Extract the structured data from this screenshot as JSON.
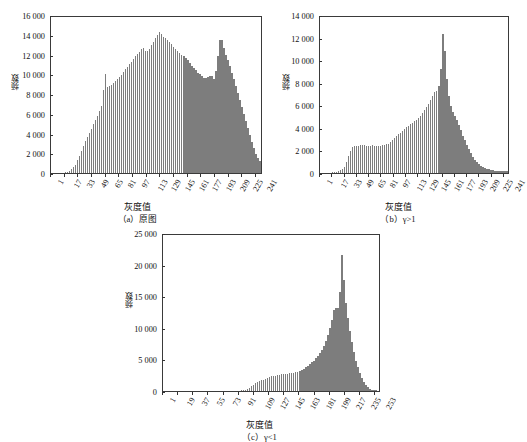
{
  "page": {
    "background": "#ffffff",
    "bar_color": "#7d7d7d",
    "axis_color": "#3a3a3a",
    "width": 519,
    "height": 442
  },
  "figures": [
    {
      "id": "a",
      "caption": "（a）原图",
      "xlabel": "灰度值",
      "ylabel": "频数"
    },
    {
      "id": "b",
      "caption": "（b）γ>1",
      "xlabel": "灰度值",
      "ylabel": "频数"
    },
    {
      "id": "c",
      "caption": "（c）γ<1",
      "xlabel": "灰度值",
      "ylabel": "频数"
    }
  ],
  "chart_data": [
    {
      "type": "bar",
      "title": "（a）原图",
      "xlabel": "灰度值",
      "ylabel": "频数",
      "ylim": [
        0,
        16000
      ],
      "yticks": [
        0,
        2000,
        4000,
        6000,
        8000,
        10000,
        12000,
        14000,
        16000
      ],
      "ytick_labels": [
        "0",
        "2 000",
        "4 000",
        "6 000",
        "8 000",
        "10 000",
        "12 000",
        "14 000",
        "16 000"
      ],
      "xlim": [
        1,
        249
      ],
      "xticks": [
        1,
        17,
        33,
        49,
        65,
        81,
        97,
        113,
        129,
        145,
        161,
        177,
        193,
        209,
        225,
        241
      ],
      "xtick_labels": [
        "1",
        "17",
        "33",
        "49",
        "65",
        "81",
        "97",
        "113",
        "129",
        "145",
        "161",
        "177",
        "193",
        "209",
        "225",
        "241"
      ],
      "grid": false,
      "legend": false,
      "x": [
        1,
        5,
        9,
        13,
        17,
        21,
        25,
        29,
        33,
        37,
        41,
        45,
        49,
        53,
        57,
        61,
        63,
        65,
        67,
        69,
        73,
        77,
        81,
        85,
        89,
        93,
        97,
        101,
        105,
        109,
        113,
        117,
        121,
        125,
        129,
        131,
        133,
        137,
        141,
        145,
        149,
        153,
        157,
        161,
        165,
        169,
        173,
        177,
        181,
        185,
        189,
        193,
        196,
        199,
        201,
        203,
        205,
        209,
        213,
        217,
        221,
        225,
        229,
        233,
        237,
        241,
        245,
        249
      ],
      "values": [
        10,
        15,
        20,
        30,
        60,
        150,
        400,
        800,
        1500,
        2400,
        3200,
        3900,
        4600,
        5400,
        6100,
        7000,
        9000,
        10200,
        8700,
        8800,
        9000,
        9300,
        9700,
        10100,
        10600,
        11000,
        11400,
        11900,
        12300,
        12800,
        12200,
        12600,
        13200,
        13800,
        14300,
        14100,
        13800,
        13600,
        13200,
        12800,
        12400,
        12100,
        11800,
        11500,
        11000,
        10600,
        10200,
        9900,
        9600,
        9700,
        9900,
        9500,
        11000,
        13400,
        13600,
        13200,
        12200,
        11400,
        10300,
        9200,
        8000,
        6800,
        5600,
        4400,
        3200,
        2100,
        1400,
        1000
      ]
    },
    {
      "type": "bar",
      "title": "（b）γ>1",
      "xlabel": "灰度值",
      "ylabel": "频数",
      "ylim": [
        0,
        14000
      ],
      "yticks": [
        0,
        2000,
        4000,
        6000,
        8000,
        10000,
        12000,
        14000
      ],
      "ytick_labels": [
        "0",
        "2 000",
        "4 000",
        "6 000",
        "8 000",
        "10 000",
        "12 000",
        "14 000"
      ],
      "xlim": [
        1,
        249
      ],
      "xticks": [
        1,
        17,
        33,
        49,
        65,
        81,
        97,
        113,
        129,
        145,
        161,
        177,
        193,
        209,
        225,
        241
      ],
      "xtick_labels": [
        "1",
        "17",
        "33",
        "49",
        "65",
        "81",
        "97",
        "113",
        "129",
        "145",
        "161",
        "177",
        "193",
        "209",
        "225",
        "241"
      ],
      "grid": false,
      "legend": false,
      "x": [
        1,
        5,
        9,
        13,
        17,
        21,
        25,
        29,
        33,
        36,
        39,
        42,
        45,
        48,
        51,
        54,
        57,
        61,
        65,
        69,
        73,
        77,
        81,
        85,
        89,
        93,
        97,
        101,
        105,
        109,
        113,
        117,
        121,
        125,
        129,
        133,
        137,
        141,
        145,
        149,
        152,
        155,
        158,
        160,
        162,
        164,
        166,
        168,
        171,
        174,
        177,
        181,
        185,
        189,
        193,
        197,
        201,
        205,
        209,
        213,
        217,
        221,
        225,
        229,
        233,
        237,
        241,
        245,
        249
      ],
      "values": [
        10,
        15,
        20,
        30,
        50,
        80,
        150,
        300,
        600,
        1100,
        1700,
        2200,
        2400,
        2350,
        2400,
        2450,
        2500,
        2400,
        2350,
        2450,
        2400,
        2350,
        2400,
        2500,
        2550,
        2700,
        3000,
        3300,
        3500,
        3700,
        4000,
        4200,
        4400,
        4600,
        4800,
        5100,
        5500,
        5900,
        6300,
        6900,
        7300,
        7200,
        8100,
        9800,
        12400,
        11400,
        9300,
        7700,
        6300,
        5600,
        5200,
        4600,
        3900,
        3200,
        2600,
        2000,
        1500,
        1100,
        800,
        600,
        450,
        350,
        280,
        230,
        200,
        180,
        160,
        150,
        140
      ]
    },
    {
      "type": "bar",
      "title": "（c）γ<1",
      "xlabel": "灰度值",
      "ylabel": "频数",
      "ylim": [
        0,
        25000
      ],
      "yticks": [
        0,
        5000,
        10000,
        15000,
        20000,
        25000
      ],
      "ytick_labels": [
        "0",
        "5 000",
        "10 000",
        "15 000",
        "20 000",
        "25 000"
      ],
      "xlim": [
        1,
        260
      ],
      "xticks": [
        1,
        19,
        37,
        55,
        73,
        91,
        109,
        127,
        145,
        163,
        181,
        199,
        217,
        235,
        253
      ],
      "xtick_labels": [
        "1",
        "19",
        "37",
        "55",
        "73",
        "91",
        "109",
        "127",
        "145",
        "163",
        "181",
        "199",
        "217",
        "235",
        "253"
      ],
      "grid": false,
      "legend": false,
      "x": [
        1,
        19,
        37,
        55,
        73,
        91,
        100,
        106,
        112,
        118,
        124,
        127,
        130,
        133,
        136,
        139,
        142,
        145,
        148,
        151,
        154,
        157,
        160,
        163,
        166,
        169,
        172,
        175,
        178,
        181,
        184,
        187,
        190,
        193,
        196,
        199,
        202,
        205,
        207,
        209,
        211,
        212,
        213,
        214,
        216,
        218,
        220,
        222,
        224,
        226,
        229,
        232,
        235,
        238,
        241,
        244,
        247,
        250,
        253,
        256
      ],
      "values": [
        5,
        5,
        5,
        5,
        5,
        10,
        200,
        700,
        1300,
        1700,
        1900,
        2100,
        2300,
        2400,
        2400,
        2500,
        2600,
        2700,
        2600,
        2700,
        2900,
        2800,
        3000,
        3100,
        3300,
        3500,
        3800,
        4200,
        4500,
        4800,
        5300,
        5800,
        6400,
        7200,
        8200,
        9400,
        11000,
        12900,
        13200,
        13000,
        13500,
        15500,
        18500,
        22300,
        19000,
        15500,
        13000,
        11200,
        9500,
        8000,
        6000,
        4400,
        3200,
        2200,
        1400,
        800,
        400,
        200,
        120,
        80
      ]
    }
  ]
}
